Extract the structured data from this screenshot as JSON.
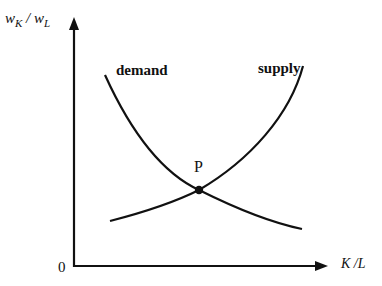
{
  "diagram": {
    "type": "supply-demand",
    "y_axis": {
      "label_main_left": "w",
      "label_sub_left": "K",
      "label_slash": " / ",
      "label_main_right": "w",
      "label_sub_right": "L"
    },
    "x_axis": {
      "label": "K /L"
    },
    "origin_label": "0",
    "curves": [
      {
        "name": "demand",
        "label": "demand",
        "direction": "downward-sloping"
      },
      {
        "name": "supply",
        "label": "supply",
        "direction": "upward-sloping"
      }
    ],
    "equilibrium": {
      "label": "P"
    },
    "colors": {
      "line": "#111111",
      "background": "#ffffff"
    }
  }
}
